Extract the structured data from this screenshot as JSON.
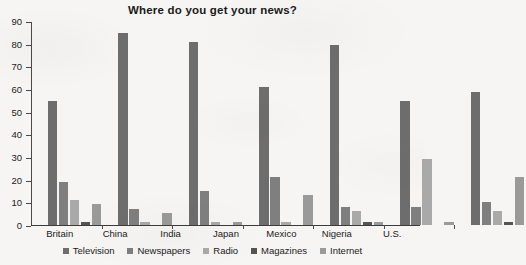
{
  "chart_data": {
    "type": "bar",
    "title": "Where do you get your news?",
    "xlabel": "",
    "ylabel": "",
    "ylim": [
      0,
      90
    ],
    "yticks": [
      0,
      10,
      20,
      30,
      40,
      50,
      60,
      70,
      80,
      90
    ],
    "grid": false,
    "legend_position": "bottom",
    "categories": [
      "Britain",
      "China",
      "India",
      "Japan",
      "Mexico",
      "Nigeria",
      "U.S."
    ],
    "series": [
      {
        "name": "Television",
        "color": "#6d6d6d",
        "values": [
          55,
          85,
          81,
          61,
          80,
          55,
          59
        ]
      },
      {
        "name": "Newspapers",
        "color": "#7f7f7f",
        "values": [
          19,
          7,
          15,
          21,
          8,
          8,
          10
        ]
      },
      {
        "name": "Radio",
        "color": "#a9a9a9",
        "values": [
          11,
          1,
          1,
          1,
          6,
          29,
          6
        ]
      },
      {
        "name": "Magazines",
        "color": "#545454",
        "values": [
          1,
          0,
          0,
          0,
          1,
          0,
          1
        ]
      },
      {
        "name": "Internet",
        "color": "#9a9a9a",
        "values": [
          9,
          5,
          1,
          13,
          1,
          1,
          21
        ]
      }
    ]
  }
}
